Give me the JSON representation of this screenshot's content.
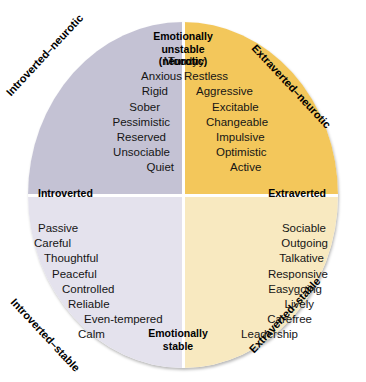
{
  "figure": {
    "name": "eysenck-personality-circle",
    "colors": {
      "upper_left": "#c4c2d4",
      "upper_right": "#f3c75b",
      "lower_left": "#e4e2ed",
      "lower_right": "#f8e9c0",
      "axis": "#ffffff",
      "text": "#151515"
    }
  },
  "axes": {
    "top_label": "Emotionally\nunstable\n(neurotic)",
    "top_label_line1": "Emotionally",
    "top_label_line2": "unstable",
    "top_label_line3": "(neurotic)",
    "bottom_label_line1": "Emotionally",
    "bottom_label_line2": "stable",
    "left_label": "Introverted",
    "right_label": "Extraverted"
  },
  "diagonals": {
    "top_left": "Introverted–neurotic",
    "top_right": "Extraverted–neurotic",
    "bottom_left": "Introverted–stable",
    "bottom_right": "Extraverted–stable"
  },
  "quadrants": {
    "upper_left": {
      "name": "introverted-neurotic",
      "traits": [
        "Moody",
        "Anxious",
        "Rigid",
        "Sober",
        "Pessimistic",
        "Reserved",
        "Unsociable",
        "Quiet"
      ]
    },
    "upper_right": {
      "name": "extraverted-neurotic",
      "traits": [
        "Touchy",
        "Restless",
        "Aggressive",
        "Excitable",
        "Changeable",
        "Impulsive",
        "Optimistic",
        "Active"
      ]
    },
    "lower_left": {
      "name": "introverted-stable",
      "traits": [
        "Passive",
        "Careful",
        "Thoughtful",
        "Peaceful",
        "Controlled",
        "Reliable",
        "Even-tempered",
        "Calm"
      ]
    },
    "lower_right": {
      "name": "extraverted-stable",
      "traits": [
        "Sociable",
        "Outgoing",
        "Talkative",
        "Responsive",
        "Easygoing",
        "Lively",
        "Carefree",
        "Leadership"
      ]
    }
  }
}
